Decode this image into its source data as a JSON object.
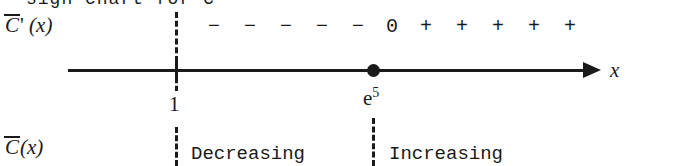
{
  "figure": {
    "type": "sign-chart",
    "clipped_heading": "sign chart for C'",
    "rows": {
      "derivative_label": {
        "function": "C",
        "prime": "'",
        "argument": "(x)",
        "overbar": true
      },
      "function_label": {
        "function": "C",
        "prime": "",
        "argument": "(x)",
        "overbar": true
      }
    },
    "axis": {
      "variable": "x",
      "arrow_direction": "right",
      "arrow_icon": "arrow-right-icon"
    },
    "critical_points": [
      {
        "id": "one",
        "label": "1",
        "exponent": "",
        "marker": "tick",
        "guide": "dashed"
      },
      {
        "id": "e5",
        "label": "e",
        "exponent": "5",
        "marker": "filled-dot",
        "guide": "dashed"
      }
    ],
    "signs": [
      {
        "value": "−",
        "region": "left"
      },
      {
        "value": "−",
        "region": "left"
      },
      {
        "value": "−",
        "region": "left"
      },
      {
        "value": "−",
        "region": "left"
      },
      {
        "value": "−",
        "region": "left"
      },
      {
        "value": "0",
        "region": "critical"
      },
      {
        "value": "+",
        "region": "right"
      },
      {
        "value": "+",
        "region": "right"
      },
      {
        "value": "+",
        "region": "right"
      },
      {
        "value": "+",
        "region": "right"
      },
      {
        "value": "+",
        "region": "right"
      }
    ],
    "behavior": {
      "left_interval": "Decreasing",
      "right_interval": "Increasing"
    },
    "colors": {
      "ink": "#1a1a1a",
      "background": "#ffffff"
    }
  }
}
